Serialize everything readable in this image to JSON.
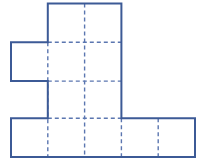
{
  "figure": {
    "colors": {
      "outline": "#3C5A96",
      "fold_line": "#5B76B0",
      "background": "#FFFFFF"
    },
    "geometry": {
      "unit": 36.8,
      "origin_x": 11,
      "origin_y": 3.5,
      "stroke_width_outline": 2,
      "stroke_width_fold": 1.4,
      "fold_dash_pattern": "4 3"
    },
    "cells": [
      {
        "name": "column-top",
        "col": 1,
        "row": 0
      },
      {
        "name": "column-middle",
        "col": 1,
        "row": 1
      },
      {
        "name": "column-bottom",
        "col": 1,
        "row": 2
      },
      {
        "name": "left-wing",
        "col": 0,
        "row": 1
      },
      {
        "name": "base-cell-1",
        "col": 0,
        "row": 3
      },
      {
        "name": "base-cell-2",
        "col": 1,
        "row": 3
      },
      {
        "name": "base-cell-3",
        "col": 2,
        "row": 3
      },
      {
        "name": "base-cell-4",
        "col": 3,
        "row": 3
      },
      {
        "name": "base-cell-5",
        "col": 4,
        "row": 3
      }
    ],
    "outline_path": "M 47.8 3.5 L 121.4 3.5 L 121.4 118.3 L 195 118.3 L 195 157 L 11 157 L 11 118.3 L 47.8 118.3 L 47.8 81.1 L 11 81.1 L 11 42.3 L 47.8 42.3 Z",
    "fold_lines": [
      {
        "name": "fold-h-row0-row1",
        "x1": 47.8,
        "y1": 42.3,
        "x2": 121.4,
        "y2": 42.3
      },
      {
        "name": "fold-h-row1-row2",
        "x1": 47.8,
        "y1": 81.1,
        "x2": 121.4,
        "y2": 81.1
      },
      {
        "name": "fold-h-row2-base",
        "x1": 47.8,
        "y1": 118.3,
        "x2": 121.4,
        "y2": 118.3
      },
      {
        "name": "fold-v-column-mid",
        "x1": 84.6,
        "y1": 3.5,
        "x2": 84.6,
        "y2": 157
      },
      {
        "name": "fold-v-left-edge",
        "x1": 47.8,
        "y1": 42.3,
        "x2": 47.8,
        "y2": 157
      },
      {
        "name": "fold-v-base-3",
        "x1": 121.4,
        "y1": 118.3,
        "x2": 121.4,
        "y2": 157
      },
      {
        "name": "fold-v-base-4",
        "x1": 158.2,
        "y1": 118.3,
        "x2": 158.2,
        "y2": 157
      }
    ]
  }
}
